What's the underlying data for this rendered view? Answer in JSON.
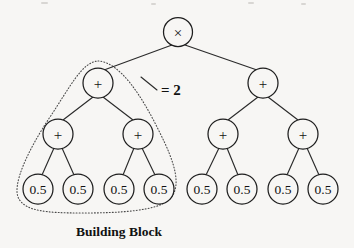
{
  "figure": {
    "background_color": "#f7f6f4",
    "stroke_color": "#1e1e1e",
    "width": 354,
    "height": 248
  },
  "caption": {
    "text": "Building Block"
  },
  "annotation": {
    "equals_two": "= 2"
  },
  "tree": {
    "root": {
      "id": "root",
      "label": "×",
      "icon": "multiply-operator-icon",
      "cx": 178,
      "cy": 32,
      "r": 14.5,
      "type": "operator"
    },
    "level2": [
      {
        "id": "n-l",
        "label": "+",
        "icon": "plus-operator-icon",
        "cx": 98,
        "cy": 83,
        "r": 15,
        "type": "operator"
      },
      {
        "id": "n-r",
        "label": "+",
        "icon": "plus-operator-icon",
        "cx": 263,
        "cy": 83,
        "r": 15,
        "type": "operator"
      }
    ],
    "level3": [
      {
        "id": "n-ll",
        "label": "+",
        "icon": "plus-operator-icon",
        "cx": 58,
        "cy": 134,
        "r": 15,
        "type": "operator"
      },
      {
        "id": "n-lr",
        "label": "+",
        "icon": "plus-operator-icon",
        "cx": 138,
        "cy": 134,
        "r": 15,
        "type": "operator"
      },
      {
        "id": "n-rl",
        "label": "+",
        "icon": "plus-operator-icon",
        "cx": 223,
        "cy": 134,
        "r": 15,
        "type": "operator"
      },
      {
        "id": "n-rr",
        "label": "+",
        "icon": "plus-operator-icon",
        "cx": 303,
        "cy": 134,
        "r": 15,
        "type": "operator"
      }
    ],
    "leaves": [
      {
        "id": "leaf-1",
        "label": "0.5",
        "cx": 38,
        "cy": 189,
        "r": 15,
        "type": "terminal"
      },
      {
        "id": "leaf-2",
        "label": "0.5",
        "cx": 78,
        "cy": 189,
        "r": 15,
        "type": "terminal"
      },
      {
        "id": "leaf-3",
        "label": "0.5",
        "cx": 119,
        "cy": 189,
        "r": 15,
        "type": "terminal"
      },
      {
        "id": "leaf-4",
        "label": "0.5",
        "cx": 159,
        "cy": 189,
        "r": 15,
        "type": "terminal"
      },
      {
        "id": "leaf-5",
        "label": "0.5",
        "cx": 202,
        "cy": 189,
        "r": 15,
        "type": "terminal"
      },
      {
        "id": "leaf-6",
        "label": "0.5",
        "cx": 242,
        "cy": 189,
        "r": 15,
        "type": "terminal"
      },
      {
        "id": "leaf-7",
        "label": "0.5",
        "cx": 283,
        "cy": 189,
        "r": 15,
        "type": "terminal"
      },
      {
        "id": "leaf-8",
        "label": "0.5",
        "cx": 323,
        "cy": 189,
        "r": 15,
        "type": "terminal"
      }
    ],
    "edges": [
      {
        "id": "e-root-l",
        "from": "root",
        "to": "n-l",
        "x1": 172,
        "y1": 45,
        "x2": 104,
        "y2": 70
      },
      {
        "id": "e-root-r",
        "from": "root",
        "to": "n-r",
        "x1": 185,
        "y1": 45,
        "x2": 257,
        "y2": 70
      },
      {
        "id": "e-l-ll",
        "from": "n-l",
        "to": "n-ll",
        "x1": 93,
        "y1": 97,
        "x2": 63,
        "y2": 120
      },
      {
        "id": "e-l-lr",
        "from": "n-l",
        "to": "n-lr",
        "x1": 103,
        "y1": 97,
        "x2": 133,
        "y2": 120
      },
      {
        "id": "e-r-rl",
        "from": "n-r",
        "to": "n-rl",
        "x1": 258,
        "y1": 97,
        "x2": 228,
        "y2": 120
      },
      {
        "id": "e-r-rr",
        "from": "n-r",
        "to": "n-rr",
        "x1": 268,
        "y1": 97,
        "x2": 298,
        "y2": 120
      },
      {
        "id": "e-ll-1",
        "from": "n-ll",
        "to": "leaf-1",
        "x1": 54,
        "y1": 148,
        "x2": 42,
        "y2": 175
      },
      {
        "id": "e-ll-2",
        "from": "n-ll",
        "to": "leaf-2",
        "x1": 62,
        "y1": 148,
        "x2": 74,
        "y2": 175
      },
      {
        "id": "e-lr-3",
        "from": "n-lr",
        "to": "leaf-3",
        "x1": 134,
        "y1": 148,
        "x2": 123,
        "y2": 175
      },
      {
        "id": "e-lr-4",
        "from": "n-lr",
        "to": "leaf-4",
        "x1": 142,
        "y1": 148,
        "x2": 155,
        "y2": 175
      },
      {
        "id": "e-rl-5",
        "from": "n-rl",
        "to": "leaf-5",
        "x1": 219,
        "y1": 148,
        "x2": 206,
        "y2": 175
      },
      {
        "id": "e-rl-6",
        "from": "n-rl",
        "to": "leaf-6",
        "x1": 227,
        "y1": 148,
        "x2": 238,
        "y2": 175
      },
      {
        "id": "e-rr-7",
        "from": "n-rr",
        "to": "leaf-7",
        "x1": 299,
        "y1": 148,
        "x2": 287,
        "y2": 175
      },
      {
        "id": "e-rr-8",
        "from": "n-rr",
        "to": "leaf-8",
        "x1": 307,
        "y1": 148,
        "x2": 319,
        "y2": 175
      }
    ]
  },
  "building_block": {
    "label": "Building Block",
    "outline_path": "M 98 61 C 120 62 142 96 160 133 C 175 163 182 186 170 199 C 158 211 120 213 82 213 C 46 213 26 211 19 199 C 11 186 28 150 50 117 C 70 87 82 62 98 61 Z",
    "annotation_leader": {
      "x1": 141,
      "y1": 77,
      "x2": 157,
      "y2": 90
    },
    "annotation_label": "= 2"
  }
}
